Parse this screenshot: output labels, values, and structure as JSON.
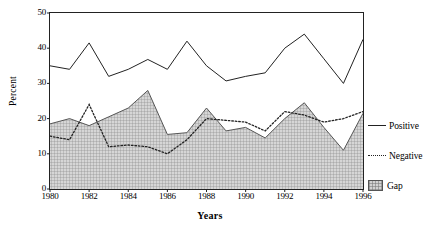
{
  "chart_data": {
    "type": "line",
    "title": "",
    "xlabel": "Years",
    "ylabel": "Percent",
    "ylim": [
      0,
      50
    ],
    "yticks": [
      0,
      10,
      20,
      30,
      40,
      50
    ],
    "xlim": [
      1980,
      1996
    ],
    "xticks": [
      1980,
      1982,
      1984,
      1986,
      1988,
      1990,
      1992,
      1994,
      1996
    ],
    "x": [
      1980,
      1981,
      1982,
      1983,
      1984,
      1985,
      1986,
      1987,
      1988,
      1989,
      1990,
      1991,
      1992,
      1993,
      1994,
      1995,
      1996
    ],
    "grid": false,
    "legend_position": "right",
    "series": [
      {
        "name": "Positive",
        "style": "solid-line",
        "values": [
          35.0,
          34.0,
          41.5,
          32.0,
          34.0,
          36.8,
          34.0,
          42.0,
          35.0,
          30.7,
          32.0,
          33.0,
          40.0,
          44.0,
          37.0,
          30.0,
          42.5
        ]
      },
      {
        "name": "Negative",
        "style": "dotted-line",
        "values": [
          15.0,
          14.0,
          24.0,
          12.0,
          12.5,
          12.0,
          10.0,
          14.0,
          20.0,
          19.5,
          19.0,
          16.5,
          22.0,
          21.0,
          19.0,
          20.0,
          22.0
        ]
      },
      {
        "name": "Gap",
        "style": "filled-area",
        "values": [
          18.5,
          20.0,
          18.0,
          20.5,
          23.0,
          28.0,
          15.5,
          16.0,
          23.0,
          16.5,
          17.5,
          14.5,
          20.0,
          24.5,
          17.5,
          11.0,
          21.5
        ]
      }
    ],
    "legend": [
      {
        "label": "Positive",
        "key": "solid-line"
      },
      {
        "label": "Negative",
        "key": "dotted-line"
      },
      {
        "label": "Gap",
        "key": "area-swatch"
      }
    ]
  },
  "colors": {
    "line": "#222222",
    "frame": "#222222",
    "fill": "#d2d2d2",
    "hatch": "#787878",
    "background": "#ffffff"
  }
}
